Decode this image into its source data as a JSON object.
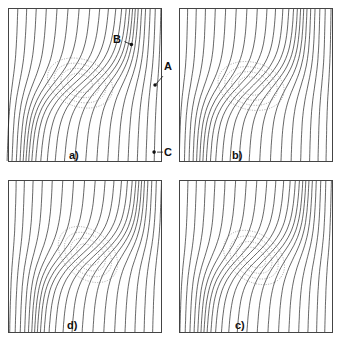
{
  "figure": {
    "panels": [
      {
        "id": "a",
        "label": "a)"
      },
      {
        "id": "b",
        "label": "b)"
      },
      {
        "id": "d",
        "label": "d)"
      },
      {
        "id": "c",
        "label": "c)"
      }
    ],
    "points": {
      "A": "A",
      "B": "B",
      "C": "C"
    },
    "colors": {
      "contour": "#222222",
      "dotted": "#777777",
      "frame": "#444444"
    }
  }
}
